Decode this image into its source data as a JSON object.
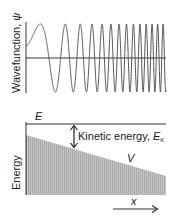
{
  "top_panel": {
    "ylabel": "Wavefunction, ",
    "ylabel_symbol": "ψ",
    "wave": {
      "x_start": 26,
      "x_end": 166,
      "zero_y": 58,
      "amplitude": 34,
      "description": "oscillation whose wavelength decreases from left to right (chirp)"
    }
  },
  "bottom_panel": {
    "ylabel": "Energy",
    "total_energy_label": "E",
    "kinetic_label": "Kinetic energy, ",
    "kinetic_symbol": "E",
    "kinetic_subscript": "K",
    "potential_label": "V",
    "x_axis_label": "x",
    "colors": {
      "shading": "#b8b8b8",
      "line": "#333333"
    }
  }
}
